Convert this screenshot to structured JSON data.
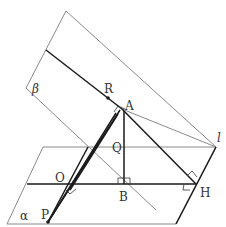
{
  "figure": {
    "type": "3d-geometry-diagram",
    "colors": {
      "thin": "#8a8a8a",
      "thick": "#1a1a1a",
      "label": "#333333"
    },
    "planes": {
      "beta": {
        "label": "β"
      },
      "alpha": {
        "label": "α"
      }
    },
    "line_l": {
      "label": "l"
    },
    "points": {
      "R": "R",
      "A": "A",
      "Q": "Q",
      "O": "O",
      "B": "B",
      "H": "H",
      "P": "P"
    }
  }
}
